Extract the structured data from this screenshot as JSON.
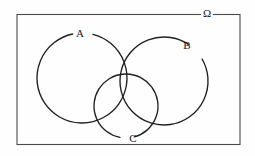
{
  "figure": {
    "type": "venn-diagram",
    "background_color": "#fefefe",
    "stroke_color": "#1f1f1f",
    "frame_color": "#4a4a4a"
  },
  "universe": {
    "label": "Ω",
    "label_name": "omega-symbol",
    "rect": {
      "x": 17,
      "y": 14.5,
      "width": 223,
      "height": 130
    },
    "label_position": {
      "x": 207,
      "y": 14.5
    }
  },
  "sets": [
    {
      "id": "A",
      "label": "A",
      "cx": 82,
      "cy": 78,
      "r": 45,
      "label_x": 80,
      "label_y": 34,
      "label_gap_start_deg": 258,
      "label_gap_end_deg": 284
    },
    {
      "id": "B",
      "label": "B",
      "cx": 164,
      "cy": 81,
      "r": 44,
      "label_x": 187,
      "label_y": 46,
      "label_gap_start_deg": 305,
      "label_gap_end_deg": 330
    },
    {
      "id": "C",
      "label": "C",
      "cx": 126,
      "cy": 106,
      "r": 32,
      "label_x": 133,
      "label_y": 139,
      "label_gap_start_deg": 75,
      "label_gap_end_deg": 101
    }
  ],
  "chart_data": {
    "type": "diagram",
    "subtype": "venn",
    "title": "",
    "set_labels": [
      "A",
      "B",
      "C"
    ],
    "universe_label": "Ω",
    "set_count": 3,
    "regions": [
      "A only",
      "B only",
      "C only",
      "A ∩ B",
      "A ∩ C",
      "B ∩ C",
      "A ∩ B ∩ C",
      "outside all sets"
    ]
  }
}
